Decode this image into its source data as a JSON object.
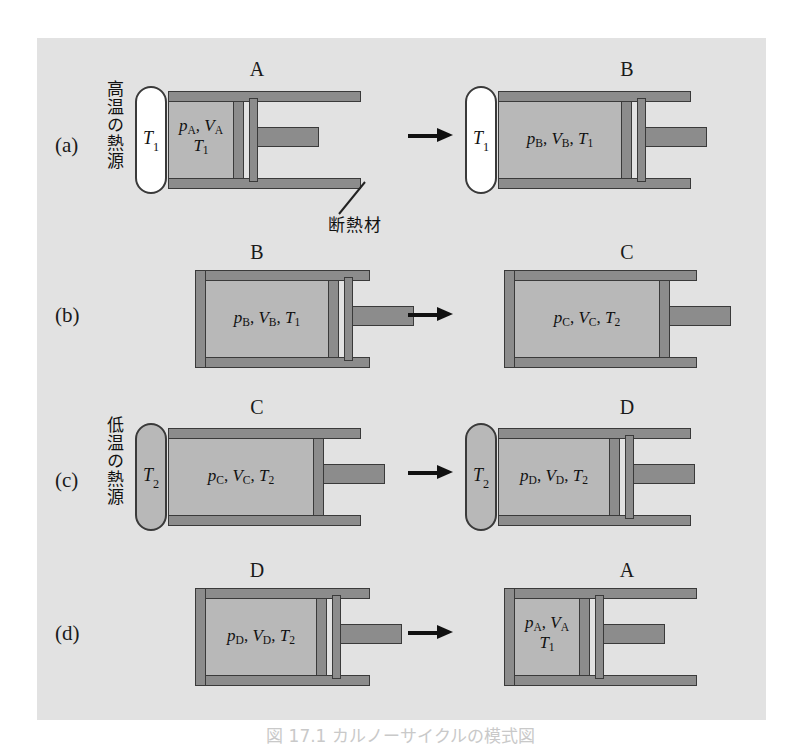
{
  "figure": {
    "caption": "図 17.1  カルノーサイクルの模式図",
    "background_color": "#e2e2e2",
    "metal_color": "#8c8c8c",
    "gas_color": "#b8b8b8",
    "outline_color": "#3a3a3a",
    "insulation_label": "断熱材",
    "hot_reservoir_label": "高温の熱源",
    "cold_reservoir_label": "低温の熱源"
  },
  "rows": [
    {
      "id": "a",
      "label": "(a)",
      "reservoir_text": "高温の熱源",
      "left": {
        "state": "A",
        "reservoir": "T₁",
        "gas_line1": "p_A, V_A",
        "gas_line2": "T₁"
      },
      "right": {
        "state": "B",
        "reservoir": "T₁",
        "gas_line1": "p_B, V_B, T₁",
        "gas_line2": ""
      },
      "arrow": "→"
    },
    {
      "id": "b",
      "label": "(b)",
      "reservoir_text": "",
      "left": {
        "state": "B",
        "reservoir": "",
        "gas_line1": "p_B, V_B, T₁",
        "gas_line2": ""
      },
      "right": {
        "state": "C",
        "reservoir": "",
        "gas_line1": "p_C, V_C, T₂",
        "gas_line2": ""
      },
      "arrow": "→"
    },
    {
      "id": "c",
      "label": "(c)",
      "reservoir_text": "低温の熱源",
      "left": {
        "state": "C",
        "reservoir": "T₂",
        "gas_line1": "p_C, V_C, T₂",
        "gas_line2": ""
      },
      "right": {
        "state": "D",
        "reservoir": "T₂",
        "gas_line1": "p_D, V_D, T₂",
        "gas_line2": ""
      },
      "arrow": "→"
    },
    {
      "id": "d",
      "label": "(d)",
      "reservoir_text": "",
      "left": {
        "state": "D",
        "reservoir": "",
        "gas_line1": "p_D, V_D, T₂",
        "gas_line2": ""
      },
      "right": {
        "state": "A",
        "reservoir": "",
        "gas_line1": "p_A, V_A",
        "gas_line2": "T₁"
      },
      "arrow": "→"
    }
  ]
}
